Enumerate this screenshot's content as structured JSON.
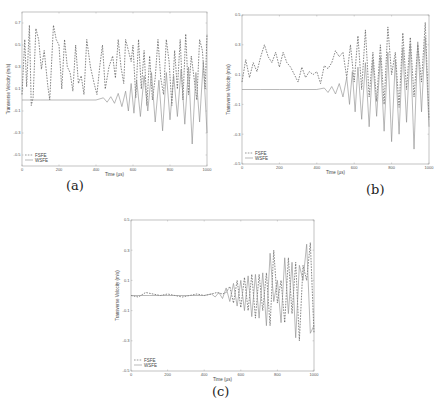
{
  "chart_data": [
    {
      "id": "a",
      "type": "line",
      "caption": "(a)",
      "title": "",
      "xlabel": "Time (µs)",
      "ylabel": "Transverse Velocity (m/s)",
      "xlim": [
        0,
        1000
      ],
      "ylim": [
        -0.6,
        0.8
      ],
      "xticks": [
        0,
        200,
        400,
        600,
        800,
        1000
      ],
      "yticks": [
        0.7,
        0.5,
        0.3,
        0.1,
        -0.1,
        -0.3,
        -0.5
      ],
      "grid": false,
      "legend": {
        "position": "lower-left",
        "entries": [
          "FSFE",
          "WSFE"
        ]
      },
      "frame": {
        "x0": 22,
        "x1": 207,
        "y0": 12,
        "y1": 166
      },
      "series": [
        {
          "name": "FSFE",
          "style": "dashed",
          "x": [
            0,
            15,
            25,
            40,
            50,
            60,
            75,
            90,
            105,
            120,
            140,
            150,
            170,
            185,
            200,
            215,
            230,
            245,
            260,
            275,
            290,
            305,
            320,
            335,
            350,
            370,
            390,
            405,
            420,
            435,
            450,
            470,
            490,
            505,
            520,
            535,
            550,
            560,
            575,
            590,
            600,
            615,
            630,
            645,
            660,
            675,
            690,
            705,
            720,
            735,
            750,
            765,
            780,
            795,
            810,
            825,
            840,
            855,
            870,
            885,
            900,
            915,
            930,
            945,
            960,
            975,
            990,
            1000
          ],
          "y": [
            0.05,
            0.55,
            0.12,
            0.68,
            -0.05,
            0.02,
            0.65,
            0.55,
            0.28,
            0.45,
            0.12,
            0.0,
            0.68,
            0.55,
            0.5,
            0.1,
            0.55,
            0.3,
            0.25,
            0.08,
            0.5,
            0.15,
            0.22,
            0.05,
            0.55,
            0.3,
            0.15,
            0.05,
            0.3,
            0.5,
            0.1,
            0.3,
            0.4,
            0.2,
            0.55,
            0.3,
            0.15,
            0.55,
            0.45,
            0.35,
            0.5,
            0.02,
            0.55,
            0.1,
            0.45,
            -0.05,
            0.4,
            0.0,
            0.2,
            0.55,
            0.2,
            0.05,
            0.55,
            0.35,
            -0.05,
            0.45,
            0.1,
            0.55,
            0.0,
            0.6,
            0.05,
            0.4,
            0.2,
            0.0,
            0.55,
            0.45,
            0.1,
            0.6
          ]
        },
        {
          "name": "WSFE",
          "style": "solid",
          "x": [
            0,
            100,
            200,
            300,
            400,
            440,
            460,
            480,
            500,
            520,
            540,
            560,
            575,
            590,
            605,
            620,
            640,
            660,
            680,
            700,
            720,
            740,
            760,
            780,
            800,
            820,
            840,
            860,
            880,
            900,
            920,
            940,
            960,
            980,
            1000
          ],
          "y": [
            0.0,
            0.0,
            0.0,
            0.0,
            0.0,
            0.02,
            -0.02,
            0.03,
            -0.03,
            0.06,
            -0.06,
            0.08,
            -0.1,
            0.15,
            -0.12,
            0.18,
            -0.15,
            0.22,
            -0.1,
            0.25,
            -0.2,
            0.18,
            -0.28,
            0.25,
            -0.18,
            0.22,
            -0.15,
            0.28,
            -0.22,
            0.3,
            -0.4,
            0.25,
            -0.2,
            0.35,
            -0.3
          ]
        }
      ]
    },
    {
      "id": "b",
      "type": "line",
      "caption": "(b)",
      "title": "",
      "xlabel": "Time (µs)",
      "ylabel": "Transverse Velocity (m/s)",
      "xlim": [
        0,
        1000
      ],
      "ylim": [
        -0.5,
        0.5
      ],
      "xticks": [
        0,
        200,
        400,
        600,
        800,
        1000
      ],
      "yticks": [
        0.5,
        0.3,
        0.1,
        -0.1,
        -0.3,
        -0.5
      ],
      "grid": false,
      "legend": {
        "position": "lower-left",
        "entries": [
          "FSFE",
          "WSFE"
        ]
      },
      "frame": {
        "x0": 242,
        "x1": 429,
        "y0": 15,
        "y1": 164
      },
      "series": [
        {
          "name": "FSFE",
          "style": "dashed",
          "x": [
            0,
            20,
            40,
            60,
            80,
            100,
            120,
            140,
            160,
            180,
            200,
            220,
            240,
            260,
            280,
            300,
            320,
            340,
            360,
            380,
            400,
            420,
            440,
            460,
            480,
            500,
            520,
            540,
            560,
            580,
            600,
            620,
            640,
            660,
            680,
            700,
            720,
            740,
            760,
            780,
            800,
            820,
            840,
            860,
            880,
            900,
            920,
            940,
            960,
            980,
            1000
          ],
          "y": [
            0.05,
            0.2,
            0.08,
            0.18,
            0.12,
            0.22,
            0.3,
            0.22,
            0.18,
            0.25,
            0.15,
            0.25,
            0.18,
            0.15,
            0.1,
            0.05,
            0.15,
            0.08,
            0.12,
            0.1,
            0.12,
            0.04,
            0.16,
            0.14,
            0.18,
            0.26,
            0.22,
            0.25,
            0.08,
            0.3,
            0.05,
            0.36,
            0.0,
            0.4,
            -0.05,
            0.25,
            -0.08,
            0.3,
            -0.1,
            0.42,
            0.1,
            0.25,
            -0.12,
            0.38,
            0.0,
            0.35,
            -0.05,
            0.3,
            0.05,
            0.45,
            -0.2
          ]
        },
        {
          "name": "WSFE",
          "style": "solid",
          "x": [
            0,
            100,
            200,
            300,
            400,
            440,
            460,
            480,
            500,
            520,
            540,
            560,
            575,
            590,
            605,
            620,
            640,
            660,
            680,
            700,
            720,
            740,
            760,
            780,
            800,
            820,
            840,
            860,
            880,
            900,
            920,
            940,
            960,
            980,
            1000
          ],
          "y": [
            0.0,
            0.0,
            0.0,
            0.0,
            0.0,
            0.01,
            -0.02,
            0.02,
            -0.03,
            0.04,
            -0.05,
            0.08,
            -0.1,
            0.12,
            -0.15,
            0.15,
            -0.2,
            0.18,
            -0.25,
            0.2,
            -0.18,
            0.22,
            -0.28,
            0.25,
            -0.35,
            0.2,
            -0.3,
            0.28,
            -0.22,
            0.3,
            -0.4,
            0.32,
            -0.15,
            0.35,
            -0.25
          ]
        }
      ]
    },
    {
      "id": "c",
      "type": "line",
      "caption": "(c)",
      "title": "",
      "xlabel": "Time (µs)",
      "ylabel": "Transverse Velocity (m/s)",
      "xlim": [
        0,
        1000
      ],
      "ylim": [
        -0.5,
        0.5
      ],
      "xticks": [
        0,
        200,
        400,
        600,
        800,
        1000
      ],
      "yticks": [
        0.5,
        0.3,
        0.1,
        -0.1,
        -0.3,
        -0.5
      ],
      "grid": false,
      "legend": {
        "position": "lower-left",
        "entries": [
          "FSFE",
          "WSFE"
        ]
      },
      "frame": {
        "x0": 131,
        "x1": 314,
        "y0": 220,
        "y1": 371
      },
      "series": [
        {
          "name": "FSFE",
          "style": "dashed",
          "x": [
            0,
            40,
            80,
            120,
            160,
            200,
            240,
            280,
            320,
            360,
            400,
            440,
            470,
            500,
            520,
            540,
            560,
            580,
            600,
            620,
            640,
            660,
            680,
            700,
            720,
            740,
            760,
            780,
            800,
            820,
            840,
            860,
            880,
            900,
            920,
            940,
            960,
            980,
            1000
          ],
          "y": [
            0.0,
            -0.01,
            0.02,
            0.01,
            0.0,
            0.01,
            0.0,
            -0.01,
            0.0,
            0.01,
            0.0,
            0.01,
            0.02,
            0.01,
            0.02,
            0.06,
            -0.05,
            0.1,
            -0.08,
            0.12,
            -0.1,
            0.14,
            -0.15,
            0.14,
            -0.1,
            0.15,
            -0.2,
            0.3,
            -0.05,
            0.1,
            -0.18,
            0.25,
            -0.12,
            0.22,
            -0.3,
            0.2,
            0.1,
            0.35,
            -0.25
          ]
        },
        {
          "name": "WSFE",
          "style": "solid",
          "x": [
            0,
            100,
            200,
            300,
            400,
            440,
            460,
            480,
            500,
            520,
            540,
            560,
            580,
            600,
            620,
            640,
            660,
            680,
            700,
            720,
            740,
            760,
            780,
            800,
            820,
            840,
            860,
            880,
            900,
            920,
            940,
            960,
            980,
            1000
          ],
          "y": [
            0.0,
            0.0,
            0.0,
            0.0,
            0.0,
            0.01,
            -0.01,
            0.02,
            -0.02,
            0.05,
            -0.04,
            0.08,
            -0.07,
            0.1,
            -0.1,
            0.13,
            -0.14,
            0.14,
            -0.15,
            0.15,
            -0.2,
            0.28,
            -0.04,
            0.1,
            -0.18,
            0.25,
            -0.12,
            0.22,
            -0.28,
            0.2,
            0.1,
            0.34,
            -0.25,
            -0.2
          ]
        }
      ]
    }
  ]
}
